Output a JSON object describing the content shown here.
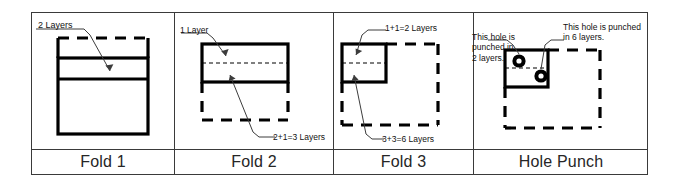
{
  "figure": {
    "line_color": "#000000",
    "frame_color": "#3a3a3a",
    "background": "#ffffff"
  },
  "columns": [
    {
      "id": "fold-1",
      "caption": "Fold 1",
      "annotations": [
        {
          "id": "layers-top",
          "text": "2 Layers"
        }
      ],
      "folded_layers": 2
    },
    {
      "id": "fold-2",
      "caption": "Fold 2",
      "annotations": [
        {
          "id": "layers-top",
          "text": "1 Layer"
        },
        {
          "id": "layers-bottom",
          "text": "2+1=3 Layers"
        }
      ],
      "folded_layers": 3
    },
    {
      "id": "fold-3",
      "caption": "Fold 3",
      "annotations": [
        {
          "id": "layers-top",
          "text": "1+1=2 Layers"
        },
        {
          "id": "layers-bottom",
          "text": "3+3=6 Layers"
        }
      ],
      "folded_layers": 6
    },
    {
      "id": "hole-punch",
      "caption": "Hole Punch",
      "annotations": [
        {
          "id": "hole-left",
          "text": "This hole is\npunched in\n2 layers."
        },
        {
          "id": "hole-right",
          "text": "This hole is punched\nin 6 layers."
        }
      ],
      "holes": 2
    }
  ]
}
